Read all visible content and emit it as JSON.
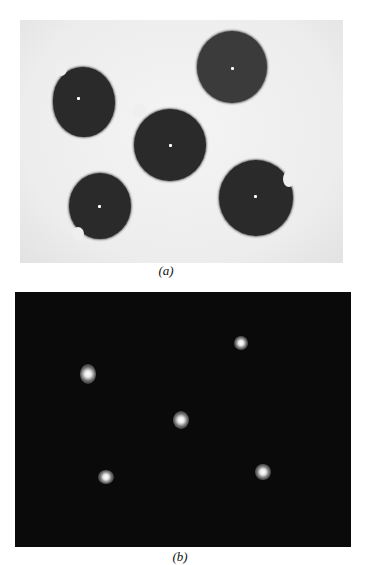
{
  "figure": {
    "panel_a": {
      "caption": "(a)",
      "description": "Five dark circular disks with white center dots on a light background",
      "disks": [
        {
          "cx": 84,
          "cy": 98,
          "r": 31,
          "notch": "top-left"
        },
        {
          "cx": 232,
          "cy": 66,
          "r": 35,
          "notch": "none"
        },
        {
          "cx": 170,
          "cy": 144,
          "r": 36,
          "notch": "top-left"
        },
        {
          "cx": 100,
          "cy": 205,
          "r": 31,
          "notch": "bottom-left"
        },
        {
          "cx": 256,
          "cy": 196,
          "r": 37,
          "notch": "top-right"
        }
      ]
    },
    "panel_b": {
      "caption": "(b)",
      "description": "Dark field with five bright spots at disk center positions",
      "spots": [
        {
          "x": 88,
          "y": 374
        },
        {
          "x": 241,
          "y": 343
        },
        {
          "x": 181,
          "y": 420
        },
        {
          "x": 106,
          "y": 478
        },
        {
          "x": 263,
          "y": 473
        }
      ]
    }
  }
}
